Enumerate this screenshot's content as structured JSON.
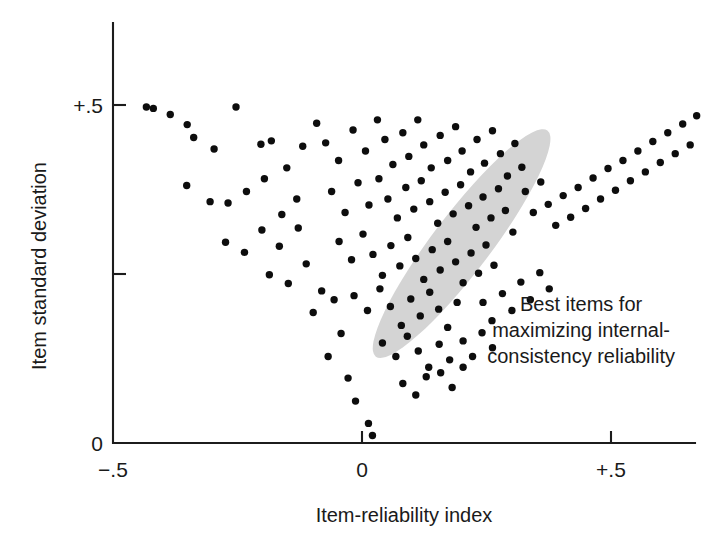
{
  "chart_data": {
    "type": "scatter",
    "title": "",
    "xlabel": "Item-reliability index",
    "ylabel": "Item standard deviation",
    "xlim": [
      -0.5,
      0.89
    ],
    "ylim": [
      0.0,
      0.585
    ],
    "grid": false,
    "legend": "none",
    "xticks": [
      {
        "value": -0.5,
        "label": "−.5"
      },
      {
        "value": 0.0,
        "label": "0"
      },
      {
        "value": 0.5,
        "label": "+.5"
      }
    ],
    "yticks": [
      {
        "value": 0.0,
        "label": "0"
      },
      {
        "value": 0.25,
        "label": ""
      },
      {
        "value": 0.5,
        "label": "+.5"
      }
    ],
    "annotations": [
      {
        "name": "best-items-callout",
        "lines": [
          "Best items for",
          "maximizing internal-",
          "consistency reliability"
        ],
        "x": 0.44,
        "y": 0.195
      }
    ],
    "shapes": [
      {
        "name": "best-items-ellipse",
        "type": "ellipse",
        "color": "#d4d4d4",
        "center_x": 0.2,
        "center_y": 0.295,
        "semi_major": 0.285,
        "semi_minor": 0.058,
        "rotation_deg": -52.8
      }
    ],
    "series": [
      {
        "name": "items",
        "marker": "circle",
        "color": "#0d0d0d",
        "marker_size_px": 7.4,
        "points": [
          [
            -0.433,
            0.497
          ],
          [
            -0.419,
            0.495
          ],
          [
            -0.385,
            0.486
          ],
          [
            -0.351,
            0.471
          ],
          [
            -0.338,
            0.452
          ],
          [
            -0.297,
            0.435
          ],
          [
            -0.253,
            0.497
          ],
          [
            -0.203,
            0.442
          ],
          [
            -0.182,
            0.447
          ],
          [
            -0.151,
            0.407
          ],
          [
            -0.119,
            0.439
          ],
          [
            -0.091,
            0.473
          ],
          [
            -0.352,
            0.381
          ],
          [
            -0.305,
            0.357
          ],
          [
            -0.269,
            0.355
          ],
          [
            -0.232,
            0.372
          ],
          [
            -0.196,
            0.391
          ],
          [
            -0.161,
            0.338
          ],
          [
            -0.131,
            0.361
          ],
          [
            -0.274,
            0.297
          ],
          [
            -0.236,
            0.282
          ],
          [
            -0.201,
            0.315
          ],
          [
            -0.166,
            0.291
          ],
          [
            -0.128,
            0.318
          ],
          [
            -0.186,
            0.249
          ],
          [
            -0.148,
            0.236
          ],
          [
            -0.112,
            0.265
          ],
          [
            -0.081,
            0.225
          ],
          [
            -0.098,
            0.193
          ],
          [
            -0.056,
            0.212
          ],
          [
            -0.042,
            0.162
          ],
          [
            -0.068,
            0.128
          ],
          [
            -0.028,
            0.096
          ],
          [
            -0.013,
            0.062
          ],
          [
            -0.073,
            0.444
          ],
          [
            -0.047,
            0.418
          ],
          [
            -0.018,
            0.463
          ],
          [
            0.007,
            0.432
          ],
          [
            0.031,
            0.478
          ],
          [
            0.046,
            0.449
          ],
          [
            0.062,
            0.412
          ],
          [
            0.082,
            0.459
          ],
          [
            0.094,
            0.424
          ],
          [
            0.112,
            0.478
          ],
          [
            0.124,
            0.441
          ],
          [
            0.139,
            0.407
          ],
          [
            0.157,
            0.455
          ],
          [
            0.172,
            0.418
          ],
          [
            0.188,
            0.468
          ],
          [
            0.201,
            0.432
          ],
          [
            0.218,
            0.401
          ],
          [
            0.231,
            0.449
          ],
          [
            0.246,
            0.414
          ],
          [
            0.262,
            0.462
          ],
          [
            0.278,
            0.428
          ],
          [
            0.292,
            0.395
          ],
          [
            0.307,
            0.443
          ],
          [
            0.321,
            0.408
          ],
          [
            -0.061,
            0.372
          ],
          [
            -0.034,
            0.341
          ],
          [
            -0.008,
            0.385
          ],
          [
            0.014,
            0.352
          ],
          [
            0.034,
            0.391
          ],
          [
            0.052,
            0.361
          ],
          [
            0.071,
            0.333
          ],
          [
            0.088,
            0.378
          ],
          [
            0.104,
            0.346
          ],
          [
            0.119,
            0.388
          ],
          [
            0.136,
            0.357
          ],
          [
            0.152,
            0.325
          ],
          [
            0.167,
            0.371
          ],
          [
            0.183,
            0.339
          ],
          [
            0.198,
            0.382
          ],
          [
            0.214,
            0.351
          ],
          [
            0.229,
            0.319
          ],
          [
            0.243,
            0.364
          ],
          [
            0.259,
            0.333
          ],
          [
            0.274,
            0.376
          ],
          [
            0.288,
            0.344
          ],
          [
            0.303,
            0.312
          ],
          [
            -0.046,
            0.298
          ],
          [
            -0.021,
            0.271
          ],
          [
            0.002,
            0.309
          ],
          [
            0.022,
            0.279
          ],
          [
            0.041,
            0.248
          ],
          [
            0.058,
            0.292
          ],
          [
            0.076,
            0.262
          ],
          [
            0.092,
            0.304
          ],
          [
            0.108,
            0.273
          ],
          [
            0.124,
            0.242
          ],
          [
            0.141,
            0.286
          ],
          [
            0.157,
            0.256
          ],
          [
            0.172,
            0.298
          ],
          [
            0.188,
            0.268
          ],
          [
            0.203,
            0.237
          ],
          [
            0.219,
            0.281
          ],
          [
            0.234,
            0.251
          ],
          [
            0.249,
            0.293
          ],
          [
            0.265,
            0.263
          ],
          [
            -0.016,
            0.218
          ],
          [
            0.011,
            0.196
          ],
          [
            0.036,
            0.228
          ],
          [
            0.057,
            0.202
          ],
          [
            0.079,
            0.174
          ],
          [
            0.098,
            0.213
          ],
          [
            0.117,
            0.188
          ],
          [
            0.136,
            0.223
          ],
          [
            0.154,
            0.198
          ],
          [
            0.172,
            0.171
          ],
          [
            0.191,
            0.208
          ],
          [
            0.041,
            0.148
          ],
          [
            0.068,
            0.128
          ],
          [
            0.091,
            0.158
          ],
          [
            0.113,
            0.136
          ],
          [
            0.134,
            0.112
          ],
          [
            0.155,
            0.146
          ],
          [
            0.176,
            0.123
          ],
          [
            0.082,
            0.088
          ],
          [
            0.108,
            0.071
          ],
          [
            0.129,
            0.098
          ],
          [
            0.328,
            0.372
          ],
          [
            0.344,
            0.341
          ],
          [
            0.359,
            0.386
          ],
          [
            0.374,
            0.353
          ],
          [
            0.389,
            0.322
          ],
          [
            0.404,
            0.366
          ],
          [
            0.419,
            0.334
          ],
          [
            0.434,
            0.378
          ],
          [
            0.449,
            0.347
          ],
          [
            0.464,
            0.392
          ],
          [
            0.479,
            0.361
          ],
          [
            0.494,
            0.406
          ],
          [
            0.509,
            0.374
          ],
          [
            0.524,
            0.418
          ],
          [
            0.539,
            0.388
          ],
          [
            0.554,
            0.432
          ],
          [
            0.569,
            0.401
          ],
          [
            0.584,
            0.446
          ],
          [
            0.599,
            0.415
          ],
          [
            0.614,
            0.459
          ],
          [
            0.629,
            0.428
          ],
          [
            0.644,
            0.472
          ],
          [
            0.659,
            0.441
          ],
          [
            0.672,
            0.484
          ],
          [
            0.243,
            0.208
          ],
          [
            0.261,
            0.181
          ],
          [
            0.282,
            0.221
          ],
          [
            0.301,
            0.196
          ],
          [
            0.319,
            0.238
          ],
          [
            0.338,
            0.212
          ],
          [
            0.357,
            0.252
          ],
          [
            0.376,
            0.228
          ],
          [
            0.203,
            0.151
          ],
          [
            0.222,
            0.128
          ],
          [
            0.241,
            0.163
          ],
          [
            0.262,
            0.141
          ],
          [
            0.158,
            0.104
          ],
          [
            0.181,
            0.082
          ],
          [
            0.203,
            0.112
          ],
          [
            0.013,
            0.029
          ],
          [
            0.021,
            0.011
          ]
        ]
      }
    ]
  }
}
